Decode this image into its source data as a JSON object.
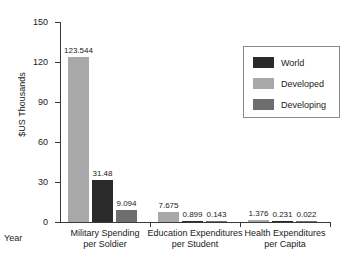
{
  "chart_data": {
    "type": "bar",
    "title": "",
    "subtitle": "",
    "xlabel": "Year",
    "ylabel": "$US Thousands",
    "ylim": [
      0,
      150
    ],
    "yticks": [
      0,
      30,
      60,
      90,
      120,
      150
    ],
    "grid": false,
    "legend_position": "top-right",
    "categories": [
      "Military Spending per Soldier",
      "Education Expenditures per Student",
      "Health Expenditures per Capita"
    ],
    "category_lines": [
      [
        "Military Spending",
        "per Soldier"
      ],
      [
        "Education Expenditures",
        "per Student"
      ],
      [
        "Health Expenditures",
        "per Capita"
      ]
    ],
    "series": [
      {
        "name": "Developed",
        "color": "#a8a8a8",
        "values": [
          123.544,
          7.675,
          1.376
        ],
        "labels": [
          "123.544",
          "7.675",
          "1.376"
        ]
      },
      {
        "name": "World",
        "color": "#2a2a2a",
        "values": [
          31.48,
          0.899,
          0.231
        ],
        "labels": [
          "31.48",
          "0.899",
          "0.231"
        ]
      },
      {
        "name": "Developing",
        "color": "#6e6e6e",
        "values": [
          9.094,
          0.143,
          0.022
        ],
        "labels": [
          "9.094",
          "0.143",
          "0.022"
        ]
      }
    ],
    "legend_entries": [
      {
        "name": "World",
        "color": "#2a2a2a"
      },
      {
        "name": "Developed",
        "color": "#a8a8a8"
      },
      {
        "name": "Developing",
        "color": "#6e6e6e"
      }
    ],
    "bar_order_in_group": [
      "Developed",
      "World",
      "Developing"
    ]
  }
}
